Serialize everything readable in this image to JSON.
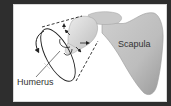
{
  "figure": {
    "type": "anatomical-diagram",
    "labels": {
      "humerus": "Humerus",
      "scapula": "Scapula"
    },
    "colors": {
      "background": "#2e2e2e",
      "panel": "#ffffff",
      "bone_light": "#d9d9d9",
      "bone_mid": "#b8b8b8",
      "bone_dark": "#8f8f8f",
      "lines": "#222222",
      "text": "#333333"
    },
    "icons": [
      "circular-motion-arrow",
      "dashed-cone-lines",
      "direction-arrows"
    ]
  }
}
